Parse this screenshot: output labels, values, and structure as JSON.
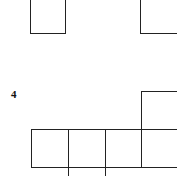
{
  "figure": {
    "problem_number": "4",
    "line_color": "#222222",
    "top_fragment": {
      "cells": [
        {
          "x": 30,
          "y": -10,
          "w": 36,
          "h": 44
        },
        {
          "x": 140,
          "y": -10,
          "w": 50,
          "h": 44
        }
      ]
    },
    "net": {
      "cells": [
        {
          "x": 141,
          "y": 91,
          "w": 50,
          "h": 39
        },
        {
          "x": 31,
          "y": 129,
          "w": 38,
          "h": 39
        },
        {
          "x": 68,
          "y": 129,
          "w": 38,
          "h": 39
        },
        {
          "x": 105,
          "y": 129,
          "w": 37,
          "h": 39
        },
        {
          "x": 141,
          "y": 129,
          "w": 50,
          "h": 39
        },
        {
          "x": 68,
          "y": 167,
          "w": 38,
          "h": 20
        }
      ]
    }
  }
}
